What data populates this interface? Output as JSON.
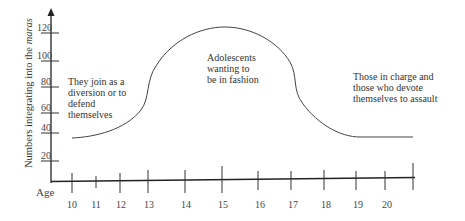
{
  "chart_data": {
    "type": "line",
    "title": "",
    "xlabel": "Age",
    "ylabel": "Numbers integrating into the maras",
    "ylabel_italic_word": "maras",
    "x_ticks": [
      "10",
      "11",
      "12",
      "13",
      "14",
      "15",
      "16",
      "17",
      "18",
      "19",
      "20"
    ],
    "y_ticks": [
      "20",
      "40",
      "60",
      "80",
      "100",
      "120"
    ],
    "ylim": [
      0,
      130
    ],
    "grid": false,
    "legend": null,
    "series": [
      {
        "name": "Gang membership curve",
        "x": [
          10,
          11,
          12,
          13,
          13.1,
          14,
          15,
          16,
          17,
          17.1,
          18,
          19,
          20,
          20.7
        ],
        "values": [
          40,
          44,
          52,
          68,
          85,
          115,
          122,
          115,
          85,
          68,
          48,
          40,
          40,
          40
        ]
      }
    ],
    "annotations": [
      {
        "lines": [
          "They join as a",
          "diversion or to",
          "defend",
          "themselves"
        ]
      },
      {
        "lines": [
          "Adolescents",
          "wanting to",
          "be in fashion"
        ]
      },
      {
        "lines": [
          "Those in charge and",
          "those who devote",
          "themselves to assault"
        ]
      }
    ]
  }
}
